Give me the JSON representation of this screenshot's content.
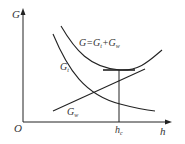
{
  "diagram": {
    "axes": {
      "y_label": "G",
      "x_label": "h",
      "origin_label": "O"
    },
    "curves": {
      "total": {
        "label_main": "G=G",
        "label_sub1": "t",
        "label_plus": "+G",
        "label_sub2": "w"
      },
      "gt": {
        "label_main": "G",
        "label_sub": "t"
      },
      "gw": {
        "label_main": "G",
        "label_sub": "w"
      }
    },
    "marker": {
      "label_main": "h",
      "label_sub": "c"
    },
    "colors": {
      "stroke": "#222222",
      "text": "#333333"
    }
  }
}
